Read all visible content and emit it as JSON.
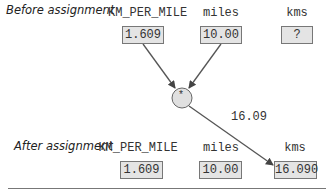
{
  "before": {
    "label": "Before assignment",
    "vars": [
      {
        "name": "KM_PER_MILE",
        "value": "1.609"
      },
      {
        "name": "miles",
        "value": "10.00"
      },
      {
        "name": "kms",
        "value": "?"
      }
    ]
  },
  "operation": {
    "operator": "*",
    "result": "16.09"
  },
  "after": {
    "label": "After assignment",
    "vars": [
      {
        "name": "KM_PER_MILE",
        "value": "1.609"
      },
      {
        "name": "miles",
        "value": "10.00"
      },
      {
        "name": "kms",
        "value": "16.090"
      }
    ]
  }
}
